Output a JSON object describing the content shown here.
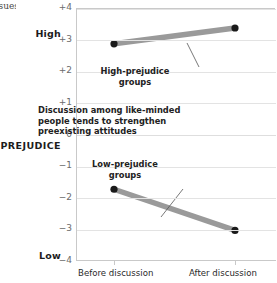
{
  "gutter_fragments": [
    "",
    "ssues.",
    "1",
    "-",
    "s",
    "",
    "1",
    ":",
    "-",
    "",
    "",
    "",
    "-",
    "s",
    "",
    "-",
    "-",
    "T",
    "s"
  ],
  "axis": {
    "y_name": "PREJUDICE",
    "y_high_label": "High",
    "y_low_label": "Low",
    "y_ticks": [
      "+4",
      "+3",
      "+2",
      "+1",
      "0",
      "−1",
      "−2",
      "−3",
      "−4"
    ],
    "x_ticks": [
      "Before discussion",
      "After discussion"
    ]
  },
  "annotations": {
    "center": "Discussion among like-minded people tends to strengthen preexisting attitudes",
    "high_line1": "High-prejudice",
    "high_line2": "groups",
    "low_line1": "Low-prejudice",
    "low_line2": "groups"
  },
  "colors": {
    "series": "#9a9a9a",
    "marker": "#1a1a1a",
    "grid": "#e3e3e3",
    "axis": "#c9c9c9",
    "text": "#222222",
    "tick_text": "#6b6b6b"
  },
  "chart_data": {
    "type": "line",
    "title": "",
    "xlabel": "",
    "ylabel": "PREJUDICE",
    "x": [
      "Before discussion",
      "After discussion"
    ],
    "ylim": [
      -4,
      4
    ],
    "ytick_values": [
      4,
      3,
      2,
      1,
      0,
      -1,
      -2,
      -3,
      -4
    ],
    "ytick_labels": [
      "+4",
      "+3",
      "+2",
      "+1",
      "0",
      "−1",
      "−2",
      "−3",
      "−4"
    ],
    "y_axis_endpoint_labels": {
      "top": "High",
      "bottom": "Low"
    },
    "grid": true,
    "legend": "none",
    "series": [
      {
        "name": "High-prejudice groups",
        "values": [
          2.9,
          3.4
        ]
      },
      {
        "name": "Low-prejudice groups",
        "values": [
          -1.7,
          -3.0
        ]
      }
    ],
    "annotations": [
      "Discussion among like-minded people tends to strengthen preexisting attitudes",
      "High-prejudice groups",
      "Low-prejudice groups"
    ]
  }
}
